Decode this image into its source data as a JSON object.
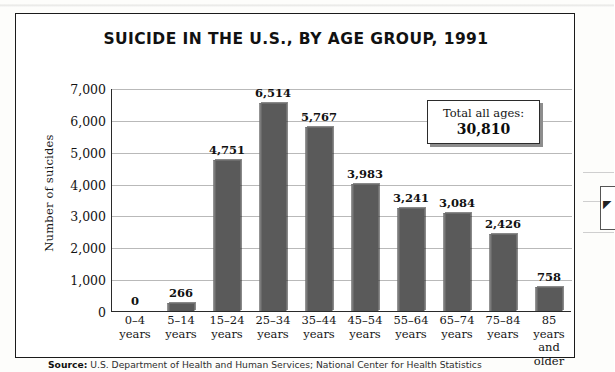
{
  "figure": {
    "title": "SUICIDE IN THE U.S., BY AGE GROUP, 1991",
    "source_prefix": "Source:",
    "source_text": "U.S. Department of Health and Human Services; National Center for Health Statistics"
  },
  "callout": {
    "label": "Total all ages:",
    "value": "30,810"
  },
  "chart_data": {
    "type": "bar",
    "title": "SUICIDE IN THE U.S., BY AGE GROUP, 1991",
    "xlabel": "",
    "ylabel": "Number of suicides",
    "ylim": [
      0,
      7000
    ],
    "ytick_step": 1000,
    "grid": true,
    "legend": "none",
    "categories": [
      "0–4\nyears",
      "5–14\nyears",
      "15–24\nyears",
      "25–34\nyears",
      "35–44\nyears",
      "45–54\nyears",
      "55–64\nyears",
      "65–74\nyears",
      "75–84\nyears",
      "85 years\nand\nolder"
    ],
    "values": [
      0,
      266,
      4751,
      6514,
      5767,
      3983,
      3241,
      3084,
      2426,
      758
    ],
    "value_labels": [
      "0",
      "266",
      "4,751",
      "6,514",
      "5,767",
      "3,983",
      "3,241",
      "3,084",
      "2,426",
      "758"
    ],
    "ytick_labels": [
      "0",
      "1,000",
      "2,000",
      "3,000",
      "4,000",
      "5,000",
      "6,000",
      "7,000"
    ],
    "total": 30810,
    "total_label": "Total all ages:",
    "bar_color": "#5a5a5a",
    "grid_color": "#b9b9b9",
    "axis_color": "#2a2a2a"
  },
  "edge_fragment": {
    "glyph": "◤"
  }
}
